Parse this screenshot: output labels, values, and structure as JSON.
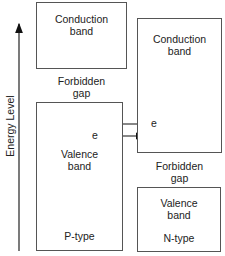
{
  "axis": {
    "label": "Energy Level"
  },
  "p_side": {
    "conduction": {
      "line1": "Conduction",
      "line2": "band"
    },
    "gap": {
      "line1": "Forbidden",
      "line2": "gap"
    },
    "valence": {
      "line1": "Valence",
      "line2": "band"
    },
    "type_label": "P-type"
  },
  "n_side": {
    "conduction": {
      "line1": "Conduction",
      "line2": "band"
    },
    "gap": {
      "line1": "Forbidden",
      "line2": "gap"
    },
    "valence": {
      "line1": "Valence",
      "line2": "band"
    },
    "type_label": "N-type"
  },
  "electrons": {
    "to_p_label": "e",
    "to_n_label": "e"
  }
}
